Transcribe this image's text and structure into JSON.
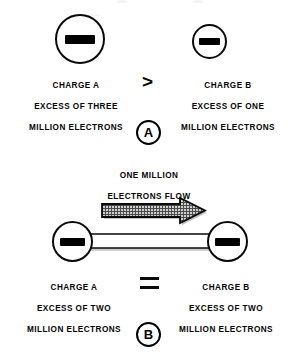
{
  "figure": {
    "background_color": "#ffffff",
    "ink_color": "#000000",
    "arrow_fill_color": "#b8b8b8"
  },
  "panel_a": {
    "badge_label": "A",
    "operator": ">",
    "operator_name": "greater-than",
    "left_charge": {
      "symbol": "minus",
      "lines": [
        "CHARGE A",
        "EXCESS OF THREE",
        "MILLION ELECTRONS"
      ]
    },
    "right_charge": {
      "symbol": "minus",
      "lines": [
        "CHARGE B",
        "EXCESS OF ONE",
        "MILLION ELECTRONS"
      ]
    }
  },
  "panel_b": {
    "badge_label": "B",
    "operator": "=",
    "operator_name": "equals",
    "flow_label": [
      "ONE MILLION",
      "ELECTRONS FLOW"
    ],
    "flow_direction": "left-to-right",
    "left_charge": {
      "symbol": "minus",
      "lines": [
        "CHARGE A",
        "EXCESS OF TWO",
        "MILLION ELECTRONS"
      ]
    },
    "right_charge": {
      "symbol": "minus",
      "lines": [
        "CHARGE B",
        "EXCESS OF TWO",
        "MILLION ELECTRONS"
      ]
    }
  }
}
